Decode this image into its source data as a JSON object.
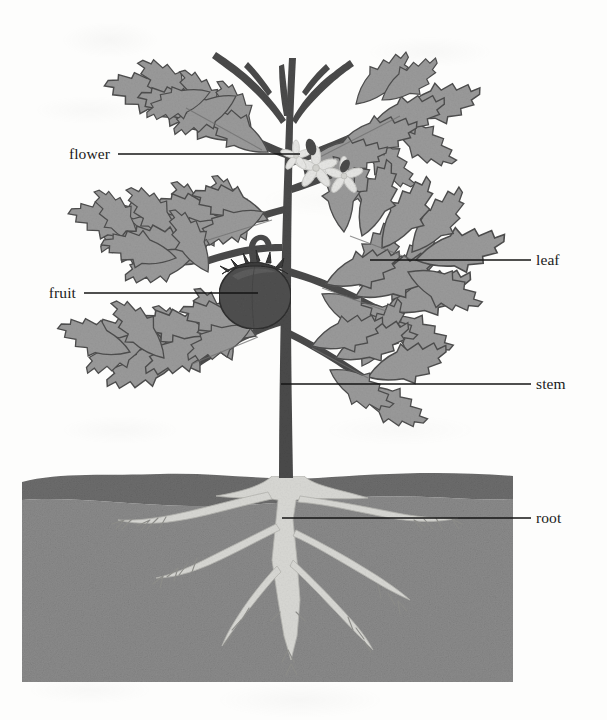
{
  "figure": {
    "background_color": "#fdfdfc"
  },
  "labels": [
    {
      "id": "flower",
      "text": "flower",
      "side": "left",
      "text_x": 110,
      "text_y": 154,
      "line_x1": 118,
      "line_x2": 300,
      "line_y": 154
    },
    {
      "id": "fruit",
      "text": "fruit",
      "side": "left",
      "text_x": 76,
      "text_y": 293,
      "line_x1": 84,
      "line_x2": 258,
      "line_y": 293
    },
    {
      "id": "leaf",
      "text": "leaf",
      "side": "right",
      "text_x": 536,
      "text_y": 260,
      "line_x1": 370,
      "line_x2": 531,
      "line_y": 260
    },
    {
      "id": "stem",
      "text": "stem",
      "side": "right",
      "text_x": 536,
      "text_y": 384,
      "line_x1": 281,
      "line_x2": 531,
      "line_y": 384
    },
    {
      "id": "root",
      "text": "root",
      "side": "right",
      "text_x": 536,
      "text_y": 518,
      "line_x1": 282,
      "line_x2": 531,
      "line_y": 518
    }
  ],
  "colors": {
    "leader_line": "#141414",
    "label_text": "#1a1a1a",
    "stem_dark": "#4a4a4a",
    "stem_outline": "#3a3a3a",
    "leaf_fill": "#9a9a9a",
    "leaf_fill_dark": "#868686",
    "leaf_outline": "#4e4e4e",
    "leaf_vein": "#6f6f6f",
    "fruit_fill": "#4f4f4f",
    "fruit_highlight": "#5d5d5d",
    "fruit_outline": "#333333",
    "calyx": "#3b3b3b",
    "flower_fill": "#e4e4e2",
    "flower_outline": "#c9c9c6",
    "soil_top": "#6d6d6d",
    "soil_bottom": "#8b8b8b",
    "root_fill": "#d8d8d4",
    "root_outline": "#b5b5b0"
  },
  "geometry": {
    "soil": {
      "left": 22,
      "right": 513,
      "top_surface_y": 476,
      "layer_split_y": 509,
      "bottom": 682
    },
    "stem": {
      "base_x": 288,
      "base_y": 476,
      "apex_y": 36
    }
  },
  "parts": [
    {
      "name": "flower",
      "description": "pale star-shaped blossom cluster on upper branch"
    },
    {
      "name": "fruit",
      "description": "dark round tomato with calyx hanging on left branch"
    },
    {
      "name": "leaf",
      "description": "compound serrated leaflets along stem"
    },
    {
      "name": "stem",
      "description": "dark vertical main stalk with branches"
    },
    {
      "name": "root",
      "description": "pale branching root system below soil line"
    }
  ]
}
